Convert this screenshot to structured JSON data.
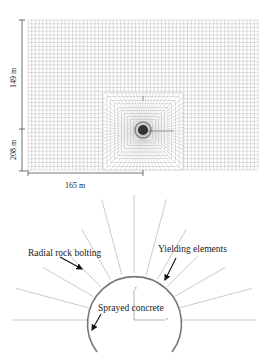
{
  "mesh_panel": {
    "dimensions": {
      "height_upper": "149 m",
      "height_lower": "208 m",
      "width_half": "165 m"
    },
    "grid": {
      "cols": 62,
      "rows": 40,
      "line_color": "#b8b8b8"
    },
    "refined_zone": {
      "color": "#9a9a9a"
    }
  },
  "tunnel_panel": {
    "labels": {
      "rock_bolting": "Radial rock bolting",
      "yielding": "Yielding elements",
      "concrete": "Sprayed concrete"
    },
    "axes": {
      "x": "x",
      "y": "y"
    },
    "colors": {
      "lining": "#777777",
      "bolts": "#bdbdbd",
      "arrow": "#111111"
    }
  }
}
